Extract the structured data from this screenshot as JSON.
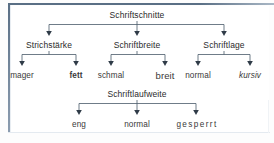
{
  "figure": {
    "title": "Schriftschnitte",
    "language": "de",
    "style": {
      "border_color": "#5a6f85",
      "background": "#ffffff",
      "line_color": "#4a5a6a",
      "text_color": "#2b2b2b"
    }
  },
  "diagram": {
    "root": {
      "label": "Schriftschnitte"
    },
    "groups": [
      {
        "label": "Strichstärke",
        "children": [
          {
            "label": "mager",
            "emphasis": "normal"
          },
          {
            "label": "fett",
            "emphasis": "bold"
          }
        ]
      },
      {
        "label": "Schriftbreite",
        "children": [
          {
            "label": "schmal",
            "emphasis": "normal"
          },
          {
            "label": "breit",
            "emphasis": "normal"
          }
        ]
      },
      {
        "label": "Schriftlage",
        "children": [
          {
            "label": "normal",
            "emphasis": "normal"
          },
          {
            "label": "kursiv",
            "emphasis": "italic"
          }
        ]
      }
    ],
    "bottom_group": {
      "label": "Schriftlaufweite",
      "children": [
        {
          "label": "eng",
          "emphasis": "normal"
        },
        {
          "label": "normal",
          "emphasis": "normal"
        },
        {
          "label": "gesperrt",
          "emphasis": "letterspaced"
        }
      ]
    }
  }
}
